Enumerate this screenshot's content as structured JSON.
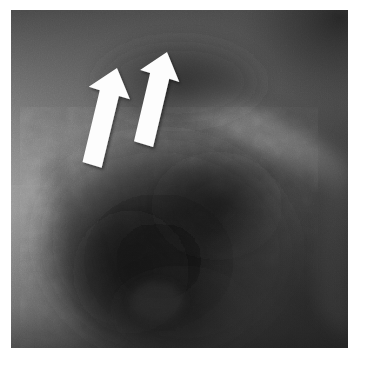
{
  "image": {
    "modality": "radiograph",
    "description": "Grayscale plain radiograph crop with two white block arrows pointing superiorly-rightward toward a region of interest",
    "canvas": {
      "width": 365,
      "height": 365
    },
    "border": {
      "color": "#ffffff",
      "left": 11,
      "top": 10,
      "right": 17,
      "bottom": 17
    },
    "film": {
      "x": 11,
      "y": 10,
      "width": 337,
      "height": 338
    }
  },
  "palette": {
    "page_background": "#ffffff",
    "film_base": "#4f4f4f",
    "soft_tissue_light": "#8a8a8a",
    "soft_tissue_mid": "#6e6e6e",
    "parenchyma_dark": "#303030",
    "dense_shadow": "#141414",
    "deepest_shadow": "#0b0b0b",
    "band_highlight": "#7d7d7d",
    "arrow_fill": "#fdfdfd",
    "arrow_shadow": "#d8d8d8"
  },
  "regions": [
    {
      "name": "upper-field",
      "tone": "#585858",
      "note": "moderately dark upper zone"
    },
    {
      "name": "left-lateral-soft-tissue",
      "tone": "#8d8d8d",
      "note": "bright vertical band along left margin"
    },
    {
      "name": "central-opacity",
      "tone": "#1a1a1a",
      "note": "large dark rounded opacity occupying lower-central field"
    },
    {
      "name": "right-curved-band",
      "tone": "#7a7a7a",
      "note": "oblique lighter curvilinear band sweeping from upper-centre to right margin"
    },
    {
      "name": "right-lower-field",
      "tone": "#3a3a3a",
      "note": "dark lower-right zone"
    },
    {
      "name": "upper-right-corner",
      "tone": "#2e2e2e",
      "note": "dark corner shadow"
    }
  ],
  "annotations": {
    "kind": "block-arrows",
    "count": 2,
    "color": "#fdfdfd",
    "direction": "up-and-slightly-right",
    "items": [
      {
        "id": "arrow-left",
        "label": "arrow-1",
        "tip": {
          "x": 117,
          "y": 68
        },
        "tail": {
          "x": 148,
          "y": 163
        },
        "rotation_deg": 17,
        "length_px": 100,
        "shaft_width_px": 20,
        "head_width_px": 43
      },
      {
        "id": "arrow-right",
        "label": "arrow-2",
        "tip": {
          "x": 167,
          "y": 52
        },
        "tail": {
          "x": 196,
          "y": 142
        },
        "rotation_deg": 17,
        "length_px": 95,
        "shaft_width_px": 20,
        "head_width_px": 41
      }
    ]
  }
}
